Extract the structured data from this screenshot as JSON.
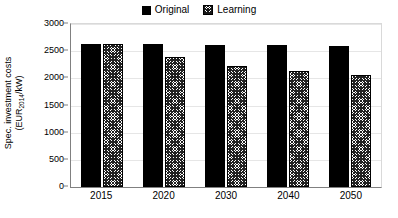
{
  "chart_data": {
    "type": "bar",
    "title": "",
    "xlabel": "",
    "ylabel": "Spec. investment costs (EUR2014/kW)",
    "ylabel_line1": "Spec. investment costs",
    "ylabel_line2_prefix": "(EUR",
    "ylabel_line2_sub": "2014",
    "ylabel_line2_suffix": "/kW)",
    "categories": [
      "2015",
      "2020",
      "2030",
      "2040",
      "2050"
    ],
    "series": [
      {
        "name": "Original",
        "values": [
          2640,
          2630,
          2615,
          2605,
          2590
        ],
        "style": "solid-black",
        "color": "#000000"
      },
      {
        "name": "Learning",
        "values": [
          2640,
          2400,
          2220,
          2140,
          2060
        ],
        "style": "hatched",
        "color": "#ffffff"
      }
    ],
    "ylim": [
      0,
      3000
    ],
    "yticks": [
      0,
      500,
      1000,
      1500,
      2000,
      2500,
      3000
    ],
    "ytick_labels": [
      "0",
      "500",
      "1000",
      "1500",
      "2000",
      "2500",
      "3000"
    ],
    "grid": true,
    "legend_position": "top-center"
  },
  "legend": {
    "entries": [
      {
        "label": "Original",
        "swatch": "solid-black-square-icon"
      },
      {
        "label": "Learning",
        "swatch": "hatched-square-icon"
      }
    ]
  },
  "colors": {
    "background": "#ffffff",
    "axis": "#808080",
    "gridline": "#e6e6e6",
    "text": "#000000",
    "series_original": "#000000",
    "series_learning": "#ffffff"
  }
}
